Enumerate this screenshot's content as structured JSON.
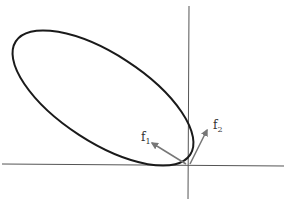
{
  "diagram": {
    "type": "vector-ellipse-diagram",
    "axes": {
      "origin": [
        188,
        165
      ],
      "x_axis": {
        "from": [
          2,
          164
        ],
        "to": [
          284,
          166
        ]
      },
      "y_axis": {
        "from": [
          189,
          6
        ],
        "to": [
          188,
          199
        ]
      }
    },
    "ellipse": {
      "cx": 103,
      "cy": 98,
      "rx": 104,
      "ry": 44,
      "rotation_deg": 33,
      "stroke": "#1a1a1a"
    },
    "vectors": [
      {
        "id": "f1",
        "label": "f",
        "subscript": "1",
        "from": [
          186,
          164
        ],
        "to": [
          152,
          143
        ],
        "color": "#777777"
      },
      {
        "id": "f2",
        "label": "f",
        "subscript": "2",
        "from": [
          190,
          164
        ],
        "to": [
          207,
          130
        ],
        "color": "#777777"
      }
    ]
  }
}
